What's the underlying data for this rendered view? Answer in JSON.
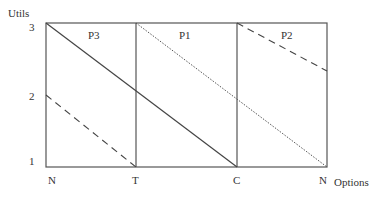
{
  "y_axis": {
    "label": "Utils",
    "ticks": [
      {
        "label": "3",
        "value": 3
      },
      {
        "label": "2",
        "value": 2
      },
      {
        "label": "1",
        "value": 1
      }
    ]
  },
  "x_axis": {
    "label": "Options",
    "ticks": [
      {
        "label": "N"
      },
      {
        "label": "T"
      },
      {
        "label": "C"
      },
      {
        "label": "N"
      }
    ]
  },
  "panels": [
    {
      "label": "P3"
    },
    {
      "label": "P1"
    },
    {
      "label": "P2"
    }
  ],
  "lines": [
    {
      "name": "P3 line",
      "style": "solid",
      "from": {
        "x": "N",
        "y": 3
      },
      "to": {
        "x": "C",
        "y": 1
      }
    },
    {
      "name": "P1 line",
      "style": "dotted",
      "from": {
        "x": "T",
        "y": 3
      },
      "to": {
        "x": "N",
        "y": 1
      }
    },
    {
      "name": "P2 line (right)",
      "style": "dashed",
      "from": {
        "x": "C",
        "y": 3
      },
      "to": {
        "x": "N",
        "y": 2.33
      }
    },
    {
      "name": "P2 line (left)",
      "style": "dashed",
      "from": {
        "x": "N",
        "y": 2
      },
      "to": {
        "x": "T",
        "y": 1
      }
    }
  ]
}
